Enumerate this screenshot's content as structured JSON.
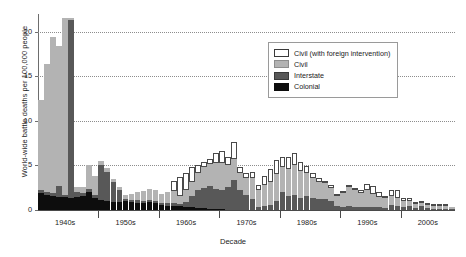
{
  "chart_data": {
    "type": "bar",
    "stacked": true,
    "title": "",
    "xlabel": "Decade",
    "ylabel": "World-wide battle deaths per 100,000 people",
    "ylim": [
      0,
      22
    ],
    "yticks": [
      0,
      5,
      10,
      15,
      20
    ],
    "ytick_labels": [
      "0",
      "5",
      "10",
      "15",
      "20"
    ],
    "grid": "horizontal-dotted",
    "legend_position": "top-right",
    "xtick_labels": [
      "1940s",
      "1950s",
      "1960s",
      "1970s",
      "1980s",
      "1990s",
      "2000s"
    ],
    "xtick_years": [
      1944,
      1954,
      1964,
      1974,
      1984,
      1994,
      2004
    ],
    "series": [
      {
        "name": "Colonial",
        "color": "#0d0d0d"
      },
      {
        "name": "Interstate",
        "color": "#585858"
      },
      {
        "name": "Civil",
        "color": "#b3b3b3"
      },
      {
        "name": "Civil (with foreign intervention)",
        "color": "#ffffff"
      }
    ],
    "x": [
      1940,
      1941,
      1942,
      1943,
      1944,
      1945,
      1946,
      1947,
      1948,
      1949,
      1950,
      1951,
      1952,
      1953,
      1954,
      1955,
      1956,
      1957,
      1958,
      1959,
      1960,
      1961,
      1962,
      1963,
      1964,
      1965,
      1966,
      1967,
      1968,
      1969,
      1970,
      1971,
      1972,
      1973,
      1974,
      1975,
      1976,
      1977,
      1978,
      1979,
      1980,
      1981,
      1982,
      1983,
      1984,
      1985,
      1986,
      1987,
      1988,
      1989,
      1990,
      1991,
      1992,
      1993,
      1994,
      1995,
      1996,
      1997,
      1998,
      1999,
      2000,
      2001,
      2002,
      2003,
      2004,
      2005,
      2006,
      2007,
      2008
    ],
    "values": {
      "Colonial": [
        1.9,
        1.7,
        1.6,
        1.5,
        1.5,
        1.4,
        1.5,
        1.6,
        2.0,
        1.4,
        1.1,
        1.0,
        0.9,
        0.9,
        1.0,
        0.9,
        0.8,
        0.8,
        0.9,
        0.8,
        0.6,
        0.5,
        0.4,
        0.4,
        0.3,
        0.3,
        0.2,
        0.2,
        0.1,
        0.1,
        0.1,
        0.0,
        0.0,
        0.0,
        0.0,
        0.0,
        0.0,
        0.0,
        0.0,
        0.0,
        0.0,
        0.0,
        0.0,
        0.0,
        0.0,
        0.0,
        0.0,
        0.0,
        0.0,
        0.0,
        0.0,
        0.0,
        0.0,
        0.0,
        0.0,
        0.0,
        0.0,
        0.0,
        0.0,
        0.0,
        0.0,
        0.0,
        0.0,
        0.0,
        0.0,
        0.0,
        0.0,
        0.0,
        0.0
      ],
      "Interstate": [
        0.3,
        0.3,
        0.3,
        1.2,
        0.2,
        19.9,
        0.5,
        0.3,
        0.4,
        0.3,
        3.9,
        3.3,
        2.3,
        1.3,
        0.2,
        0.2,
        0.3,
        0.2,
        0.2,
        0.2,
        0.2,
        0.3,
        0.4,
        0.3,
        0.6,
        1.3,
        2.0,
        2.3,
        2.6,
        2.3,
        2.2,
        2.6,
        3.4,
        2.2,
        1.7,
        1.2,
        0.3,
        0.4,
        0.6,
        1.0,
        2.0,
        1.6,
        1.7,
        1.4,
        1.6,
        1.4,
        1.2,
        1.2,
        1.0,
        0.4,
        0.3,
        0.5,
        0.3,
        0.3,
        0.3,
        0.3,
        0.3,
        0.2,
        0.6,
        0.5,
        0.3,
        0.4,
        0.2,
        0.4,
        0.2,
        0.1,
        0.1,
        0.1,
        0.1
      ],
      "Civil": [
        10.1,
        14.4,
        17.5,
        15.7,
        19.8,
        0.2,
        0.6,
        0.7,
        2.6,
        2.1,
        0.5,
        0.4,
        0.3,
        0.4,
        0.5,
        0.7,
        0.9,
        1.1,
        1.3,
        1.3,
        1.0,
        1.2,
        1.3,
        0.9,
        1.3,
        1.6,
        1.9,
        2.3,
        2.5,
        2.9,
        3.0,
        2.5,
        2.3,
        2.0,
        1.9,
        2.4,
        2.0,
        2.4,
        2.6,
        3.0,
        2.8,
        3.0,
        3.4,
        3.0,
        2.6,
        2.2,
        2.0,
        1.8,
        1.5,
        1.2,
        1.6,
        2.1,
        1.9,
        1.6,
        2.0,
        1.5,
        1.2,
        1.1,
        1.0,
        0.8,
        0.7,
        0.6,
        0.5,
        0.4,
        0.4,
        0.3,
        0.3,
        0.3,
        0.2
      ],
      "Civil (with foreign intervention)": [
        0.0,
        0.0,
        0.0,
        0.0,
        0.0,
        0.0,
        0.0,
        0.0,
        0.0,
        0.0,
        0.0,
        0.0,
        0.0,
        0.0,
        0.0,
        0.0,
        0.0,
        0.0,
        0.0,
        0.0,
        0.0,
        0.0,
        1.2,
        2.1,
        1.9,
        1.6,
        0.9,
        0.6,
        0.5,
        1.1,
        1.3,
        0.8,
        1.9,
        0.6,
        0.5,
        0.7,
        0.5,
        1.0,
        1.4,
        1.6,
        1.2,
        1.4,
        1.3,
        1.0,
        0.7,
        0.5,
        0.4,
        0.3,
        0.3,
        0.2,
        0.1,
        0.1,
        0.2,
        0.3,
        0.6,
        0.9,
        0.5,
        0.3,
        0.6,
        0.9,
        0.4,
        0.3,
        0.2,
        0.2,
        0.1,
        0.1,
        0.1,
        0.1,
        0.0
      ]
    }
  },
  "legend": {
    "items": [
      {
        "label": "Civil (with foreign intervention)",
        "swatch": "civilfi"
      },
      {
        "label": "Civil",
        "swatch": "civil"
      },
      {
        "label": "Interstate",
        "swatch": "interstate"
      },
      {
        "label": "Colonial",
        "swatch": "colonial"
      }
    ]
  }
}
